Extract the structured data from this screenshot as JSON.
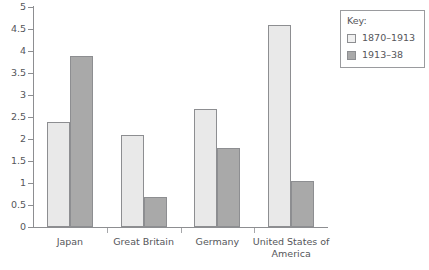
{
  "chart_data": {
    "type": "bar",
    "title": "",
    "xlabel": "",
    "ylabel": "",
    "ylim": [
      0,
      5
    ],
    "ytick_step": 0.5,
    "yticks": [
      "0",
      "0.5",
      "1",
      "1.5",
      "2",
      "2.5",
      "3",
      "3.5",
      "4",
      "4.5",
      "5"
    ],
    "grid": false,
    "legend_position": "top-right",
    "categories": [
      "Japan",
      "Great Britain",
      "Germany",
      "United States of America"
    ],
    "series": [
      {
        "name": "1870–1913",
        "values": [
          2.38,
          2.1,
          2.68,
          4.6
        ],
        "color": "#e9e9e9"
      },
      {
        "name": "1913–38",
        "values": [
          3.88,
          0.68,
          1.8,
          1.05
        ],
        "color": "#a9a9a9"
      }
    ]
  },
  "legend": {
    "title": "Key:",
    "entries": [
      {
        "label": "1870–1913",
        "swatch": "light"
      },
      {
        "label": "1913–38",
        "swatch": "dark"
      }
    ]
  },
  "caption": {
    "text": ""
  },
  "colors": {
    "series_light": "#e9e9e9",
    "series_dark": "#a9a9a9",
    "axis": "#8d8e91",
    "text": "#55565a"
  }
}
